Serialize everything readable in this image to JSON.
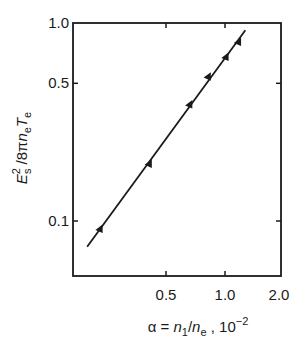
{
  "chart_data": {
    "type": "scatter",
    "title": "",
    "xlabel": "α = n₁/nₑ, 10⁻²",
    "ylabel": "E_s² / 8πnₑTₑ",
    "xscale": "log",
    "yscale": "log",
    "xlim": [
      0.168,
      2.0
    ],
    "ylim": [
      0.053,
      1.0
    ],
    "x_ticks": [
      0.5,
      1.0,
      2.0
    ],
    "x_tick_labels": [
      "0.5",
      "1.0",
      "2.0"
    ],
    "y_ticks": [
      0.1,
      0.5,
      1.0
    ],
    "y_tick_labels": [
      "0.1",
      "0.5",
      "1.0"
    ],
    "grid": false,
    "legend": null,
    "series": [
      {
        "name": "measured",
        "marker": "triangle",
        "x": [
          0.23,
          0.41,
          0.66,
          0.82,
          1.01,
          1.17
        ],
        "y": [
          0.091,
          0.195,
          0.39,
          0.54,
          0.68,
          0.81
        ]
      },
      {
        "name": "fit line",
        "style": "line",
        "x": [
          0.198,
          1.27
        ],
        "y": [
          0.074,
          0.93
        ]
      }
    ]
  },
  "axes": {
    "x_label_parts": {
      "alpha": "α",
      "eq": " = ",
      "n": "n",
      "sub1": "1",
      "slash": "/",
      "n2": "n",
      "sube": "e",
      "comma": " , 10",
      "exp": "−2"
    },
    "y_label_parts": {
      "E": "E",
      "sup": "2",
      "sub": "s",
      "rest1": " /8π",
      "n": "n",
      "sube": "e",
      "T": "T",
      "subT": "e"
    }
  }
}
